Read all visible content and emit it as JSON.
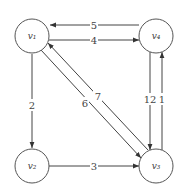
{
  "diagram": {
    "type": "directed-weighted-graph",
    "nodes": [
      {
        "id": "v1",
        "label": "v₁"
      },
      {
        "id": "v2",
        "label": "v₂"
      },
      {
        "id": "v3",
        "label": "v₃"
      },
      {
        "id": "v4",
        "label": "v₄"
      }
    ],
    "edges": [
      {
        "from": "v4",
        "to": "v1",
        "weight": "5"
      },
      {
        "from": "v1",
        "to": "v4",
        "weight": "4"
      },
      {
        "from": "v1",
        "to": "v2",
        "weight": "2"
      },
      {
        "from": "v2",
        "to": "v3",
        "weight": "3"
      },
      {
        "from": "v1",
        "to": "v3",
        "weight": "6"
      },
      {
        "from": "v3",
        "to": "v1",
        "weight": "7"
      },
      {
        "from": "v4",
        "to": "v3",
        "weight": "12"
      },
      {
        "from": "v3",
        "to": "v4",
        "weight": "1"
      }
    ]
  }
}
